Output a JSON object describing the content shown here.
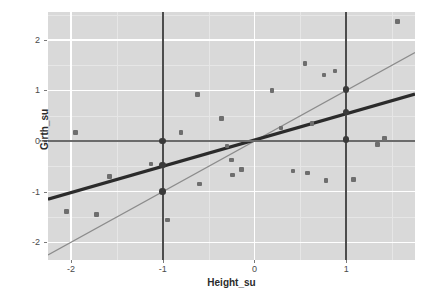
{
  "chart_data": {
    "type": "scatter",
    "title": "",
    "xlabel": "Height_su",
    "ylabel": "Girth_su",
    "xlim": [
      -2.25,
      1.75
    ],
    "ylim": [
      -2.35,
      2.55
    ],
    "xticks": [
      -2,
      -1,
      0,
      1
    ],
    "yticks": [
      -2,
      -1,
      0,
      1,
      2
    ],
    "xtick_labels": [
      "-2",
      "-1",
      "0",
      "1"
    ],
    "ytick_labels": [
      "-2",
      "-1",
      "0",
      "1",
      "2"
    ],
    "grid": "major-white-minor-light",
    "legend": "none",
    "panel_background": "#d9d9d9",
    "point_color": "#6e6e6e",
    "emphasis_point_color": "#3a3a3a",
    "fit_line_color": "#2b2b2b",
    "identity_line_color": "#8c8c8c",
    "vline_color": "#4d4d4d",
    "hline_color": "#6b6b6b",
    "points": [
      {
        "x": -1.95,
        "y": 0.17
      },
      {
        "x": -2.05,
        "y": -1.39
      },
      {
        "x": -1.72,
        "y": -1.45
      },
      {
        "x": -1.58,
        "y": -0.7
      },
      {
        "x": -1.13,
        "y": -0.45
      },
      {
        "x": -0.95,
        "y": -1.56
      },
      {
        "x": -0.8,
        "y": 0.17
      },
      {
        "x": -0.62,
        "y": 0.92
      },
      {
        "x": -0.6,
        "y": -0.85
      },
      {
        "x": -0.36,
        "y": 0.45
      },
      {
        "x": -0.3,
        "y": -0.1
      },
      {
        "x": -0.25,
        "y": -0.37
      },
      {
        "x": -0.24,
        "y": -0.67
      },
      {
        "x": -0.14,
        "y": -0.56
      },
      {
        "x": 0.19,
        "y": 1.0
      },
      {
        "x": 0.29,
        "y": 0.26
      },
      {
        "x": 0.42,
        "y": -0.59
      },
      {
        "x": 0.55,
        "y": 1.53
      },
      {
        "x": 0.58,
        "y": -0.63
      },
      {
        "x": 0.63,
        "y": 0.35
      },
      {
        "x": 0.76,
        "y": 1.31
      },
      {
        "x": 0.78,
        "y": -0.78
      },
      {
        "x": 0.88,
        "y": 1.38
      },
      {
        "x": 1.08,
        "y": -0.76
      },
      {
        "x": 1.34,
        "y": -0.07
      },
      {
        "x": 1.42,
        "y": 0.05
      },
      {
        "x": 1.56,
        "y": 2.36
      }
    ],
    "emphasis_points": [
      {
        "x": -1,
        "y": 0.0
      },
      {
        "x": -1,
        "y": -0.47
      },
      {
        "x": -1,
        "y": -1.0
      },
      {
        "x": 1,
        "y": 1.02
      },
      {
        "x": 1,
        "y": 0.57
      },
      {
        "x": 1,
        "y": 0.03
      }
    ],
    "fit_line": {
      "slope": 0.52,
      "intercept": 0.02,
      "width": 3.2
    },
    "identity_line": {
      "slope": 1.0,
      "intercept": 0.0,
      "width": 1.2
    },
    "vlines": [
      -1,
      1
    ],
    "hlines": [
      0
    ]
  }
}
